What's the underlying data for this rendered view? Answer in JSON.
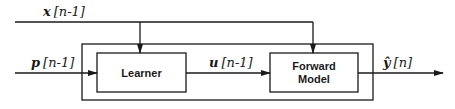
{
  "diagram": {
    "signals": {
      "x_input": {
        "symbol": "x",
        "index": "[n-1]"
      },
      "p_input": {
        "symbol": "p",
        "index": "[n-1]"
      },
      "u_intermediate": {
        "symbol": "u",
        "index": "[n-1]"
      },
      "y_output": {
        "symbol": "ŷ",
        "index": "[n]"
      }
    },
    "blocks": {
      "learner": {
        "label": "Learner"
      },
      "forward_model": {
        "line1": "Forward",
        "line2": "Model"
      }
    },
    "colors": {
      "line": "#1a1a1a",
      "background": "#ffffff"
    }
  }
}
